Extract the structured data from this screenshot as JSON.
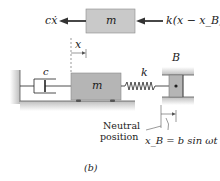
{
  "figure": {
    "caption": "(b)",
    "fbd": {
      "mass_label": "m",
      "left_force": "cẋ",
      "right_force": "k(x − x_B)"
    },
    "system": {
      "displacement_label": "x",
      "damper_label": "c",
      "mass_label": "m",
      "spring_label": "k",
      "support_label": "B",
      "neutral_label_line1": "Neutral",
      "neutral_label_line2": "position",
      "support_motion": "x_B = b sin ωt"
    },
    "colors": {
      "mass_fill": "#b5b5b5",
      "mass_fill_top": "#c9c9c9",
      "ground": "#cfcfcf",
      "line": "#222222"
    }
  }
}
